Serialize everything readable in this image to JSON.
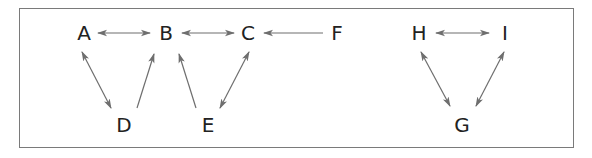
{
  "diagram": {
    "type": "directed-graph",
    "colors": {
      "node_text": "#222222",
      "edge": "#6e6e6e",
      "frame": "#7a7a7a",
      "background": "#ffffff"
    },
    "nodes": [
      {
        "id": "A",
        "label": "A",
        "x": 84,
        "y": 33
      },
      {
        "id": "B",
        "label": "B",
        "x": 166,
        "y": 33
      },
      {
        "id": "C",
        "label": "C",
        "x": 248,
        "y": 33
      },
      {
        "id": "F",
        "label": "F",
        "x": 337,
        "y": 33
      },
      {
        "id": "D",
        "label": "D",
        "x": 124,
        "y": 125
      },
      {
        "id": "E",
        "label": "E",
        "x": 208,
        "y": 125
      },
      {
        "id": "H",
        "label": "H",
        "x": 419,
        "y": 33
      },
      {
        "id": "I",
        "label": "I",
        "x": 505,
        "y": 33
      },
      {
        "id": "G",
        "label": "G",
        "x": 462,
        "y": 125
      }
    ],
    "edges": [
      {
        "from": "A",
        "to": "B",
        "type": "bidirectional",
        "x1": 98,
        "y1": 33,
        "x2": 150,
        "y2": 33
      },
      {
        "from": "B",
        "to": "C",
        "type": "bidirectional",
        "x1": 182,
        "y1": 33,
        "x2": 234,
        "y2": 33
      },
      {
        "from": "F",
        "to": "C",
        "type": "directed",
        "x1": 323,
        "y1": 33,
        "x2": 264,
        "y2": 33
      },
      {
        "from": "A",
        "to": "D",
        "type": "bidirectional",
        "x1": 82,
        "y1": 52,
        "x2": 111,
        "y2": 108
      },
      {
        "from": "D",
        "to": "B",
        "type": "directed",
        "x1": 137,
        "y1": 108,
        "x2": 154,
        "y2": 54
      },
      {
        "from": "E",
        "to": "B",
        "type": "directed",
        "x1": 196,
        "y1": 108,
        "x2": 179,
        "y2": 54
      },
      {
        "from": "C",
        "to": "E",
        "type": "bidirectional",
        "x1": 249,
        "y1": 52,
        "x2": 220,
        "y2": 108
      },
      {
        "from": "H",
        "to": "I",
        "type": "bidirectional",
        "x1": 436,
        "y1": 33,
        "x2": 489,
        "y2": 33
      },
      {
        "from": "H",
        "to": "G",
        "type": "bidirectional",
        "x1": 421,
        "y1": 52,
        "x2": 450,
        "y2": 106
      },
      {
        "from": "I",
        "to": "G",
        "type": "bidirectional",
        "x1": 504,
        "y1": 52,
        "x2": 476,
        "y2": 106
      }
    ]
  }
}
